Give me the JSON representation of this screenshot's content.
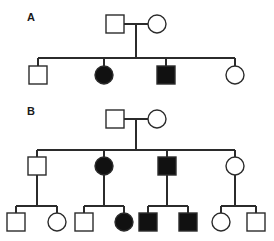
{
  "figure": {
    "type": "pedigree-chart",
    "background_color": "#ffffff",
    "line_color": "#2b2b2b",
    "affected_fill": "#111111",
    "unaffected_fill": "#ffffff",
    "panels": [
      {
        "id": "A",
        "label": "A",
        "label_x": 27,
        "label_y": 21,
        "generations": [
          {
            "id": "A-I",
            "members": [
              {
                "id": "A-I-1",
                "shape": "square",
                "sex": "male",
                "affected": false,
                "cx": 115,
                "cy": 24
              },
              {
                "id": "A-I-2",
                "shape": "circle",
                "sex": "female",
                "affected": false,
                "cx": 157,
                "cy": 24
              }
            ]
          },
          {
            "id": "A-II",
            "members": [
              {
                "id": "A-II-1",
                "shape": "square",
                "sex": "male",
                "affected": false,
                "cx": 38,
                "cy": 75
              },
              {
                "id": "A-II-2",
                "shape": "circle",
                "sex": "female",
                "affected": true,
                "cx": 104,
                "cy": 75
              },
              {
                "id": "A-II-3",
                "shape": "square",
                "sex": "male",
                "affected": true,
                "cx": 166,
                "cy": 75
              },
              {
                "id": "A-II-4",
                "shape": "circle",
                "sex": "female",
                "affected": false,
                "cx": 235,
                "cy": 75
              }
            ]
          }
        ]
      },
      {
        "id": "B",
        "label": "B",
        "label_x": 27,
        "label_y": 115,
        "generations": [
          {
            "id": "B-I",
            "members": [
              {
                "id": "B-I-1",
                "shape": "square",
                "sex": "male",
                "affected": false,
                "cx": 115,
                "cy": 119
              },
              {
                "id": "B-I-2",
                "shape": "circle",
                "sex": "female",
                "affected": false,
                "cx": 157,
                "cy": 119
              }
            ]
          },
          {
            "id": "B-II",
            "members": [
              {
                "id": "B-II-1",
                "shape": "square",
                "sex": "male",
                "affected": false,
                "cx": 37,
                "cy": 166
              },
              {
                "id": "B-II-2",
                "shape": "circle",
                "sex": "female",
                "affected": true,
                "cx": 104,
                "cy": 166
              },
              {
                "id": "B-II-3",
                "shape": "square",
                "sex": "male",
                "affected": true,
                "cx": 167,
                "cy": 166
              },
              {
                "id": "B-II-4",
                "shape": "circle",
                "sex": "female",
                "affected": false,
                "cx": 235,
                "cy": 166
              }
            ]
          },
          {
            "id": "B-III",
            "members": [
              {
                "id": "B-III-1",
                "shape": "square",
                "sex": "male",
                "affected": false,
                "cx": 16,
                "cy": 222
              },
              {
                "id": "B-III-2",
                "shape": "circle",
                "sex": "female",
                "affected": false,
                "cx": 57,
                "cy": 222
              },
              {
                "id": "B-III-3",
                "shape": "square",
                "sex": "male",
                "affected": false,
                "cx": 84,
                "cy": 222
              },
              {
                "id": "B-III-4",
                "shape": "circle",
                "sex": "female",
                "affected": true,
                "cx": 124,
                "cy": 222
              },
              {
                "id": "B-III-5",
                "shape": "square",
                "sex": "male",
                "affected": true,
                "cx": 148,
                "cy": 222
              },
              {
                "id": "B-III-6",
                "shape": "square",
                "sex": "male",
                "affected": true,
                "cx": 188,
                "cy": 222
              },
              {
                "id": "B-III-7",
                "shape": "circle",
                "sex": "female",
                "affected": false,
                "cx": 221,
                "cy": 222
              },
              {
                "id": "B-III-8",
                "shape": "square",
                "sex": "male",
                "affected": false,
                "cx": 256,
                "cy": 222
              }
            ]
          }
        ]
      }
    ]
  }
}
